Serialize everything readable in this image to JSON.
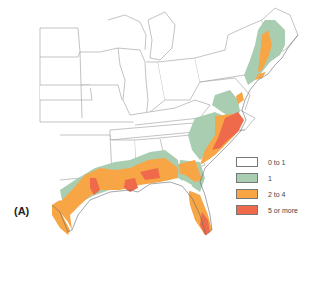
{
  "figure": {
    "panel_label": "(A)",
    "legend": {
      "items": [
        {
          "label": "0 to 1",
          "color": "#ffffff"
        },
        {
          "label": "1",
          "color": "#a9cdb0"
        },
        {
          "label": "2 to 4",
          "color": "#f7a545"
        },
        {
          "label": "5 or more",
          "color": "#ee6a4a"
        }
      ]
    },
    "colors": {
      "state_border": "#9a9a9a",
      "coast": "#6a6a6a",
      "background": "#ffffff"
    }
  }
}
